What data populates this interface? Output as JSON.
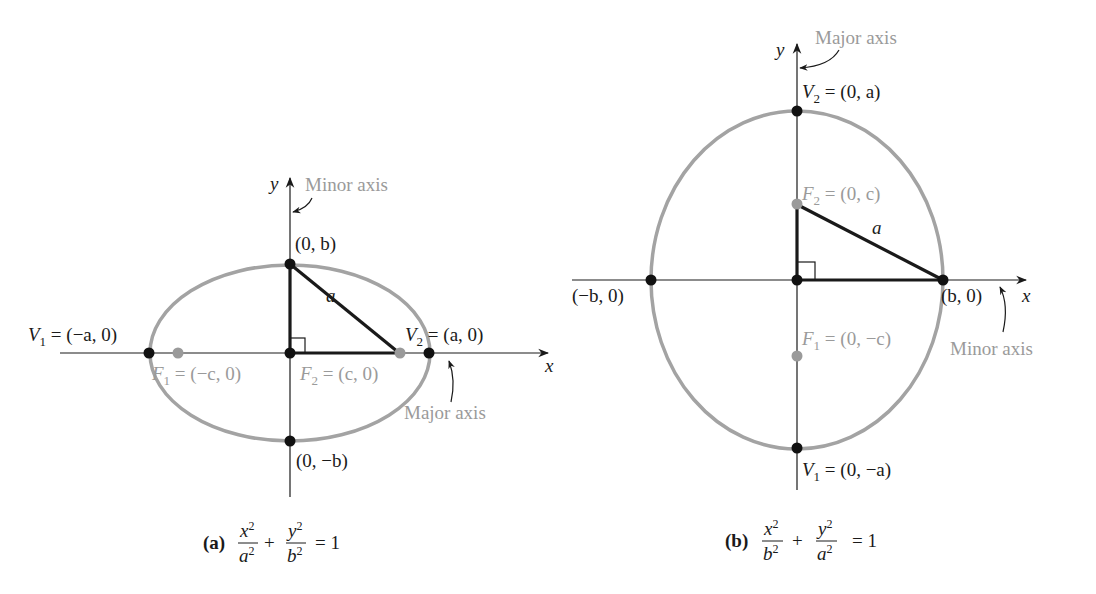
{
  "colors": {
    "ellipse": "#a3a3a3",
    "axis": "#1a1a1a",
    "vertex_point": "#111111",
    "focus_point": "#9a9a9a",
    "gray_text": "#9a9a9a"
  },
  "panel_a": {
    "axis_x_label": "x",
    "axis_y_label": "y",
    "minor_axis_label": "Minor axis",
    "major_axis_label": "Major axis",
    "top_point": "(0, b)",
    "bottom_point": "(0, −b)",
    "v1": {
      "name": "V",
      "sub": "1",
      "value": " = (−a, 0)"
    },
    "v2": {
      "name": "V",
      "sub": "2",
      "value": " = (a, 0)"
    },
    "f1": {
      "name": "F",
      "sub": "1",
      "value": " = (−c, 0)"
    },
    "f2": {
      "name": "F",
      "sub": "2",
      "value": " = (c, 0)"
    },
    "hyp_label": "a",
    "caption_tag": "(a)",
    "caption_eq": {
      "t1_num": "x",
      "t1_den": "a",
      "t2_num": "y",
      "t2_den": "b",
      "plus": "+",
      "rhs": "= 1",
      "exp": "2"
    }
  },
  "panel_b": {
    "axis_x_label": "x",
    "axis_y_label": "y",
    "major_axis_label": "Major axis",
    "minor_axis_label": "Minor axis",
    "left_point": "(−b, 0)",
    "right_point": "(b, 0)",
    "v2": {
      "name": "V",
      "sub": "2",
      "value": " = (0, a)"
    },
    "v1": {
      "name": "V",
      "sub": "1",
      "value": " = (0, −a)"
    },
    "f2": {
      "name": "F",
      "sub": "2",
      "value": " = (0, c)"
    },
    "f1": {
      "name": "F",
      "sub": "1",
      "value": " = (0, −c)"
    },
    "hyp_label": "a",
    "caption_tag": "(b)",
    "caption_eq": {
      "t1_num": "x",
      "t1_den": "b",
      "t2_num": "y",
      "t2_den": "a",
      "plus": "+",
      "rhs": "= 1",
      "exp": "2"
    }
  }
}
